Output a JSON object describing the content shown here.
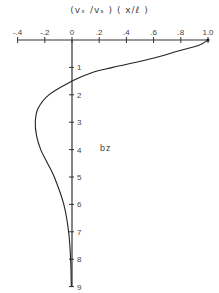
{
  "chart_data": {
    "type": "line",
    "title": "(vₓ /vₛ ) ( x/ℓ )",
    "xlabel": "(vx/vs)(x/l)",
    "ylabel": "bz",
    "x_axis_position": "top",
    "xlim": [
      -0.4,
      1.0
    ],
    "ylim": [
      0,
      9
    ],
    "y_inverted": true,
    "grid": false,
    "x_ticks": [
      "-.4",
      "-.2",
      "0",
      ".2",
      ".4",
      ".6",
      ".8",
      "1.0"
    ],
    "x_tick_values": [
      -0.4,
      -0.2,
      0,
      0.2,
      0.4,
      0.6,
      0.8,
      1.0
    ],
    "y_ticks": [
      "1",
      "2",
      "3",
      "4",
      "5",
      "6",
      "7",
      "8",
      "9"
    ],
    "y_tick_values": [
      1,
      2,
      3,
      4,
      5,
      6,
      7,
      8,
      9
    ],
    "series": [
      {
        "name": "profile",
        "points": [
          {
            "bz": 0.0,
            "value": 1.0
          },
          {
            "bz": 0.2,
            "value": 0.93
          },
          {
            "bz": 0.4,
            "value": 0.78
          },
          {
            "bz": 0.65,
            "value": 0.61
          },
          {
            "bz": 1.0,
            "value": 0.3
          },
          {
            "bz": 1.2,
            "value": 0.14
          },
          {
            "bz": 1.5,
            "value": 0.0
          },
          {
            "bz": 2.0,
            "value": -0.17
          },
          {
            "bz": 2.5,
            "value": -0.25
          },
          {
            "bz": 3.0,
            "value": -0.27
          },
          {
            "bz": 3.5,
            "value": -0.26
          },
          {
            "bz": 4.0,
            "value": -0.23
          },
          {
            "bz": 4.5,
            "value": -0.18
          },
          {
            "bz": 5.0,
            "value": -0.13
          },
          {
            "bz": 6.0,
            "value": -0.06
          },
          {
            "bz": 7.0,
            "value": -0.025
          },
          {
            "bz": 8.0,
            "value": -0.01
          },
          {
            "bz": 9.0,
            "value": -0.005
          }
        ]
      }
    ]
  },
  "labels": {
    "title": "(vₓ /vₛ ) ( x/ℓ )",
    "ylabel": "bz"
  }
}
